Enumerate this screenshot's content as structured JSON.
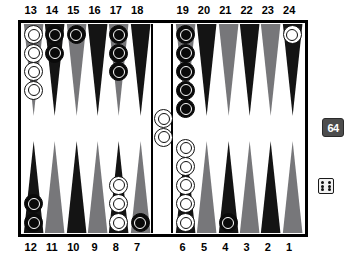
{
  "app": {
    "title": "Backgammon Board",
    "board_label": "backgammon-position"
  },
  "labels": {
    "top": [
      "13",
      "14",
      "15",
      "16",
      "17",
      "18",
      "19",
      "20",
      "21",
      "22",
      "23",
      "24"
    ],
    "bottom": [
      "12",
      "11",
      "10",
      "9",
      "8",
      "7",
      "6",
      "5",
      "4",
      "3",
      "2",
      "1"
    ]
  },
  "colors": {
    "point_dark": "#141414",
    "point_light": "#77777a",
    "board_bg": "#ffffff",
    "frame": "#000000",
    "checker_white": "#ffffff",
    "checker_black": "#0a0a0a",
    "cube_bg": "#4d4d4d",
    "cube_text": "#ffffff",
    "die_face": "#f2f2f2",
    "die_pip": "#111111"
  },
  "doubling_cube": {
    "value": "64",
    "position": "right-edge-middle"
  },
  "dice": [
    {
      "value": 6,
      "pips": 6
    }
  ],
  "bar": {
    "white_count": 2,
    "black_count": 0
  },
  "points": [
    {
      "num": "13",
      "quad": "tl",
      "slot": 0,
      "shade": "light",
      "color": "white",
      "count": 4
    },
    {
      "num": "14",
      "quad": "tl",
      "slot": 1,
      "shade": "dark",
      "color": "black",
      "count": 2
    },
    {
      "num": "15",
      "quad": "tl",
      "slot": 2,
      "shade": "light",
      "color": "black",
      "count": 1
    },
    {
      "num": "16",
      "quad": "tl",
      "slot": 3,
      "shade": "dark",
      "color": "none",
      "count": 0
    },
    {
      "num": "17",
      "quad": "tl",
      "slot": 4,
      "shade": "light",
      "color": "black",
      "count": 3
    },
    {
      "num": "18",
      "quad": "tl",
      "slot": 5,
      "shade": "dark",
      "color": "none",
      "count": 0
    },
    {
      "num": "19",
      "quad": "tr",
      "slot": 0,
      "shade": "light",
      "color": "black",
      "count": 5
    },
    {
      "num": "20",
      "quad": "tr",
      "slot": 1,
      "shade": "dark",
      "color": "none",
      "count": 0
    },
    {
      "num": "21",
      "quad": "tr",
      "slot": 2,
      "shade": "light",
      "color": "none",
      "count": 0
    },
    {
      "num": "22",
      "quad": "tr",
      "slot": 3,
      "shade": "dark",
      "color": "none",
      "count": 0
    },
    {
      "num": "23",
      "quad": "tr",
      "slot": 4,
      "shade": "light",
      "color": "none",
      "count": 0
    },
    {
      "num": "24",
      "quad": "tr",
      "slot": 5,
      "shade": "dark",
      "color": "white",
      "count": 1
    },
    {
      "num": "12",
      "quad": "bl",
      "slot": 0,
      "shade": "dark",
      "color": "black",
      "count": 2
    },
    {
      "num": "11",
      "quad": "bl",
      "slot": 1,
      "shade": "light",
      "color": "none",
      "count": 0
    },
    {
      "num": "10",
      "quad": "bl",
      "slot": 2,
      "shade": "dark",
      "color": "none",
      "count": 0
    },
    {
      "num": "9",
      "quad": "bl",
      "slot": 3,
      "shade": "light",
      "color": "none",
      "count": 0
    },
    {
      "num": "8",
      "quad": "bl",
      "slot": 4,
      "shade": "dark",
      "color": "white",
      "count": 3
    },
    {
      "num": "7",
      "quad": "bl",
      "slot": 5,
      "shade": "light",
      "color": "black",
      "count": 1
    },
    {
      "num": "6",
      "quad": "br",
      "slot": 0,
      "shade": "dark",
      "color": "white",
      "count": 5
    },
    {
      "num": "5",
      "quad": "br",
      "slot": 1,
      "shade": "light",
      "color": "none",
      "count": 0
    },
    {
      "num": "4",
      "quad": "br",
      "slot": 2,
      "shade": "dark",
      "color": "black",
      "count": 1
    },
    {
      "num": "3",
      "quad": "br",
      "slot": 3,
      "shade": "light",
      "color": "none",
      "count": 0
    },
    {
      "num": "2",
      "quad": "br",
      "slot": 4,
      "shade": "dark",
      "color": "none",
      "count": 0
    },
    {
      "num": "1",
      "quad": "br",
      "slot": 5,
      "shade": "light",
      "color": "none",
      "count": 0
    }
  ]
}
